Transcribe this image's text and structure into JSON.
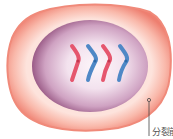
{
  "diagram": {
    "label": "分裂前",
    "colors": {
      "membrane_outer": "#f08a7a",
      "membrane_inner": "#fbd7cf",
      "nucleus_center": "#fbf2f7",
      "nucleus_edge": "#9a5a86",
      "chromosome_red": "#e5566e",
      "chromosome_blue": "#4f88c6",
      "label_line": "#444444"
    },
    "chromosomes": [
      {
        "color": "red"
      },
      {
        "color": "blue"
      },
      {
        "color": "red"
      },
      {
        "color": "blue"
      }
    ]
  }
}
